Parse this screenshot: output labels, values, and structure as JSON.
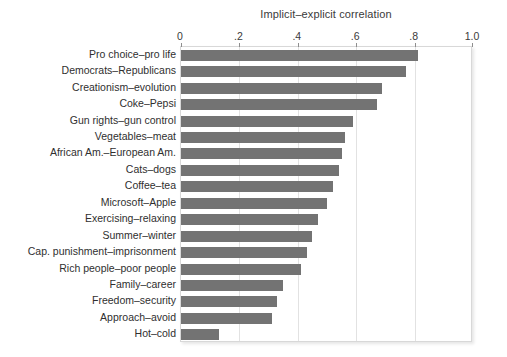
{
  "chart_data": {
    "type": "bar",
    "orientation": "horizontal",
    "title": "Implicit–explicit correlation",
    "xlabel": "",
    "ylabel": "",
    "xlim": [
      0,
      1.0
    ],
    "grid": true,
    "legend": false,
    "xticks": [
      0,
      0.2,
      0.4,
      0.6,
      0.8,
      1.0
    ],
    "xtick_labels": [
      "0",
      ".2",
      ".4",
      ".6",
      ".8",
      "1.0"
    ],
    "categories": [
      "Pro choice–pro life",
      "Democrats–Republicans",
      "Creationism–evolution",
      "Coke–Pepsi",
      "Gun rights–gun control",
      "Vegetables–meat",
      "African Am.–European Am.",
      "Cats–dogs",
      "Coffee–tea",
      "Microsoft–Apple",
      "Exercising–relaxing",
      "Summer–winter",
      "Cap. punishment–imprisonment",
      "Rich people–poor people",
      "Family–career",
      "Freedom–security",
      "Approach–avoid",
      "Hot–cold"
    ],
    "values": [
      0.81,
      0.77,
      0.69,
      0.67,
      0.59,
      0.56,
      0.55,
      0.54,
      0.52,
      0.5,
      0.47,
      0.45,
      0.43,
      0.41,
      0.35,
      0.33,
      0.31,
      0.13
    ],
    "bar_color": "#737373",
    "background_color": "#ffffff",
    "gridline_color": "#e2e2e2"
  }
}
